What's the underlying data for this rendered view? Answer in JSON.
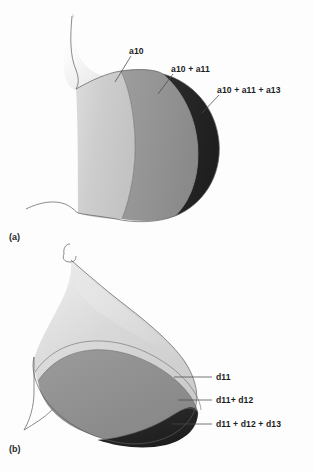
{
  "figure": {
    "kind": "two-panel anatomical layer diagram",
    "background_color": "#ffffff"
  },
  "palette": {
    "light_gray": "#cbcbcb",
    "mid_gray": "#949494",
    "dark": "#262626",
    "outline": "#5a5a5a",
    "leader_line": "#4a4a4a",
    "text": "#1d1d1d",
    "halftone_tint": "#e9e9e9"
  },
  "panels": [
    {
      "tag": "(a)",
      "labels": [
        {
          "text": "a10",
          "region": "light-gray-band"
        },
        {
          "text": "a10 + a11",
          "region": "mid-gray-band"
        },
        {
          "text": "a10 + a11 + a13",
          "region": "dark-band"
        }
      ]
    },
    {
      "tag": "(b)",
      "labels": [
        {
          "text": "d11",
          "region": "light-gray-band"
        },
        {
          "text": "d11+ d12",
          "region": "mid-gray-band"
        },
        {
          "text": "d11 + d12 + d13",
          "region": "dark-band"
        }
      ]
    }
  ],
  "caption_fragment": {
    "text": "",
    "note": "cropped caption line at very bottom edge, illegible"
  }
}
